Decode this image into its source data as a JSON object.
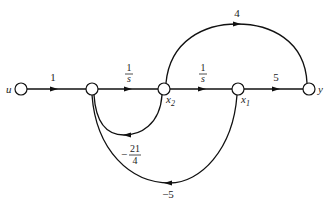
{
  "diagram": {
    "type": "signal-flow-graph",
    "nodes": [
      {
        "id": "u",
        "label": "u",
        "x": 21,
        "y": 89
      },
      {
        "id": "n1",
        "label": "",
        "x": 92,
        "y": 89
      },
      {
        "id": "x2",
        "label": "x",
        "sub": "2",
        "x": 164,
        "y": 89
      },
      {
        "id": "x1",
        "label": "x",
        "sub": "1",
        "x": 238,
        "y": 89
      },
      {
        "id": "y",
        "label": "y",
        "x": 309,
        "y": 89
      }
    ],
    "edges": [
      {
        "from": "u",
        "to": "n1",
        "gain": "1"
      },
      {
        "from": "n1",
        "to": "x2",
        "gain_num": "1",
        "gain_den": "s"
      },
      {
        "from": "x2",
        "to": "x1",
        "gain_num": "1",
        "gain_den": "s"
      },
      {
        "from": "x1",
        "to": "y",
        "gain": "5"
      },
      {
        "from": "x2",
        "to": "y",
        "gain": "4"
      },
      {
        "from": "x2",
        "to": "n1",
        "gain_sign": "−",
        "gain_num": "21",
        "gain_den": "4"
      },
      {
        "from": "x1",
        "to": "n1",
        "gain": "−5"
      }
    ]
  }
}
